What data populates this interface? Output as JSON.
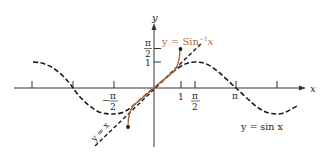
{
  "figure": {
    "x_axis_label": "x",
    "y_axis_label": "y",
    "curves": {
      "sin": {
        "label": "y = sin x",
        "style": "dashed",
        "color": "#1a1a1a"
      },
      "arcsin": {
        "label_prefix": "y = Sin",
        "label_exp": "−1",
        "label_var": "x",
        "color": "#b06a3b"
      },
      "identity": {
        "label": "y = x",
        "style": "dashed",
        "color": "#1a1a1a"
      }
    },
    "x_ticks": [
      {
        "value": "-3π/2",
        "label": ""
      },
      {
        "value": "-π",
        "label": ""
      },
      {
        "value": "-π/2",
        "label_sign": "−",
        "label_num": "π",
        "label_den": "2"
      },
      {
        "value": "1",
        "label": "1"
      },
      {
        "value": "π/2",
        "label_num": "π",
        "label_den": "2"
      },
      {
        "value": "π",
        "label": "π"
      },
      {
        "value": "3π/2",
        "label": ""
      }
    ],
    "y_ticks": [
      {
        "value": "1",
        "label": "1"
      },
      {
        "value": "π/2",
        "label_num": "π",
        "label_den": "2"
      }
    ]
  }
}
